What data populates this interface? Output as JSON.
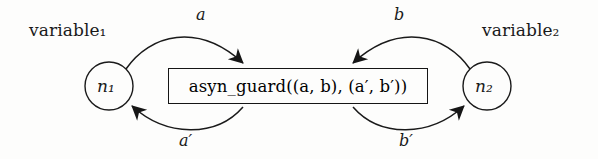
{
  "figure": {
    "type": "state-transition-diagram",
    "background_color": "#fdfdfc",
    "stroke_color": "#1a1a1a"
  },
  "annotations": {
    "variable_left": "variable₁",
    "variable_right": "variable₂"
  },
  "nodes": [
    {
      "id": "n1",
      "label": "n₁",
      "cx": 109,
      "cy": 86,
      "r": 24
    },
    {
      "id": "n2",
      "label": "n₂",
      "cx": 487,
      "cy": 86,
      "r": 24
    }
  ],
  "guard_box": {
    "text": "asyn_guard((a, b), (a′, b′))",
    "function_name": "asyn_guard",
    "arguments": "((a, b), (a′, b′))",
    "border_color": "#151515"
  },
  "edges": [
    {
      "id": "edge-a",
      "label": "a",
      "from": "n1",
      "to": "guard-box",
      "position": "top-left",
      "direction": "right"
    },
    {
      "id": "edge-b",
      "label": "b",
      "from": "n2",
      "to": "guard-box",
      "position": "top-right",
      "direction": "left"
    },
    {
      "id": "edge-a-prime",
      "label": "a′",
      "from": "guard-box",
      "to": "n1",
      "position": "bottom-left",
      "direction": "left"
    },
    {
      "id": "edge-b-prime",
      "label": "b′",
      "from": "guard-box",
      "to": "n2",
      "position": "bottom-right",
      "direction": "right"
    }
  ]
}
